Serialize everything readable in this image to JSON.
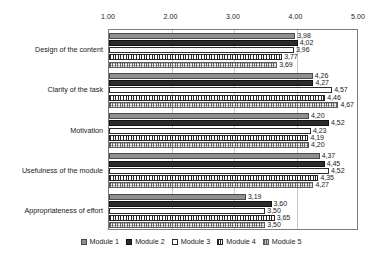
{
  "chart_data": {
    "type": "bar",
    "orientation": "horizontal",
    "title": "",
    "xlabel": "",
    "ylabel": "",
    "xlim": [
      1.0,
      5.0
    ],
    "xticks": [
      "1.00",
      "2.00",
      "3.00",
      "4.00",
      "5.00"
    ],
    "xtick_values": [
      1,
      2,
      3,
      4,
      5
    ],
    "grid": true,
    "legend_position": "bottom",
    "categories": [
      "Design of the content",
      "Clarity of the task",
      "Motivation",
      "Usefulness of the module",
      "Appropriateness of effort"
    ],
    "series": [
      {
        "name": "Module 1",
        "color": "#8f8f8f",
        "pattern": "solid-gray",
        "values": [
          3.98,
          4.26,
          4.2,
          4.37,
          3.19
        ],
        "labels": [
          "3,98",
          "4,26",
          "4,20",
          "4,37",
          "3,19"
        ]
      },
      {
        "name": "Module 2",
        "color": "#2b2b2b",
        "pattern": "solid-dark",
        "values": [
          4.02,
          4.27,
          4.52,
          4.45,
          3.6
        ],
        "labels": [
          "4,02",
          "4,27",
          "4,52",
          "4,45",
          "3,60"
        ]
      },
      {
        "name": "Module 3",
        "color": "#ffffff",
        "pattern": "solid-white",
        "values": [
          3.96,
          4.57,
          4.23,
          4.52,
          3.5
        ],
        "labels": [
          "3,96",
          "4,57",
          "4,23",
          "4,52",
          "3,50"
        ]
      },
      {
        "name": "Module 4",
        "color": "#262626",
        "pattern": "vertical-stripes",
        "values": [
          3.77,
          4.46,
          4.19,
          4.35,
          3.65
        ],
        "labels": [
          "3,77",
          "4,46",
          "4,19",
          "4,35",
          "3,65"
        ]
      },
      {
        "name": "Module 5",
        "color": "#bdbdbd",
        "pattern": "dotted-grid",
        "values": [
          3.69,
          4.67,
          4.2,
          4.27,
          3.5
        ],
        "labels": [
          "3,69",
          "4,67",
          "4,20",
          "4,27",
          "3,50"
        ]
      }
    ]
  },
  "legend": {
    "items": [
      "Module 1",
      "Module 2",
      "Module 3",
      "Module 4",
      "Module 5"
    ]
  }
}
